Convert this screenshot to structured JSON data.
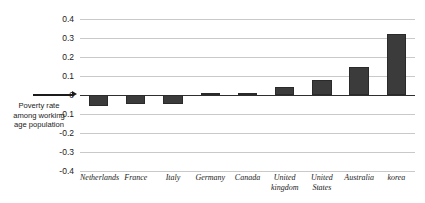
{
  "chart_data": {
    "type": "bar",
    "title": "",
    "xlabel": "",
    "ylabel": "Poverty rate among working age population",
    "ylim": [
      -0.4,
      0.4
    ],
    "ytick_labels": [
      "0.4",
      "0.3",
      "0.2",
      "0.1",
      "0",
      "-0.1",
      "-0.2",
      "-0.3",
      "-0.4"
    ],
    "ytick_values": [
      0.4,
      0.3,
      0.2,
      0.1,
      0,
      -0.1,
      -0.2,
      -0.3,
      -0.4
    ],
    "grid": true,
    "legend": "none",
    "categories": [
      "Netherlands",
      "France",
      "Italy",
      "Germany",
      "Canada",
      "United kingdom",
      "United States",
      "Australia",
      "korea"
    ],
    "values": [
      -0.06,
      -0.045,
      -0.045,
      0.01,
      0.01,
      0.04,
      0.08,
      0.15,
      0.32
    ],
    "bar_color": "#3b3b3b",
    "zero_line_color": "#2e2e2e",
    "grid_color": "#c9c9c9"
  },
  "axis": {
    "y_label_line1": "Poverty rate",
    "y_label_line2": "among working",
    "y_label_line3": "age population",
    "zero_marker": "arrow-right"
  }
}
